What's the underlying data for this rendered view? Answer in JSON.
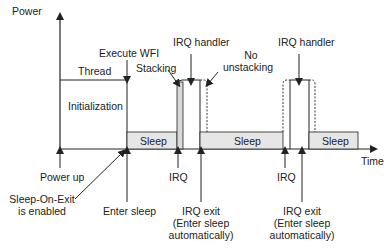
{
  "axes": {
    "y_label": "Power",
    "x_label": "Time"
  },
  "states": {
    "thread": "Thread",
    "initialization": "Initialization",
    "sleep1": "Sleep",
    "sleep2": "Sleep",
    "sleep3": "Sleep"
  },
  "top_labels": {
    "execute_wfi": "Execute WFI",
    "stacking": "Stacking",
    "irq_handler_1": "IRQ handler",
    "no_unstacking_1": "No",
    "no_unstacking_2": "unstacking",
    "irq_handler_2": "IRQ handler"
  },
  "bottom_labels": {
    "power_up": "Power up",
    "sleep_on_exit_1": "Sleep-On-Exit",
    "sleep_on_exit_2": "is enabled",
    "enter_sleep": "Enter sleep",
    "irq_1": "IRQ",
    "irq_exit_1_a": "IRQ exit",
    "irq_exit_1_b": "(Enter sleep",
    "irq_exit_1_c": "automatically)",
    "irq_2": "IRQ",
    "irq_exit_2_a": "IRQ exit",
    "irq_exit_2_b": "(Enter sleep",
    "irq_exit_2_c": "automatically)"
  },
  "colors": {
    "line": "#222222",
    "sleep_fill": "#e6e6e6",
    "stacking_fill": "#d9d9d9"
  }
}
